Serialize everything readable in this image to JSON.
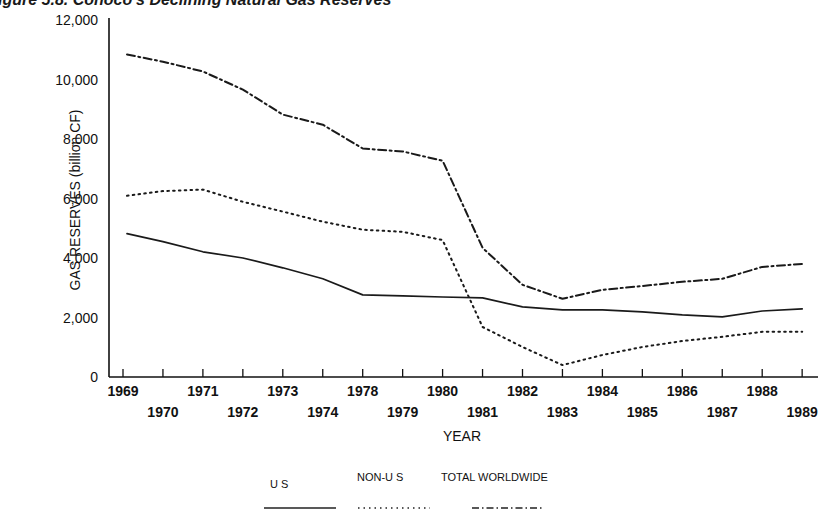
{
  "title": "igure 5.8. Conoco's Declining Natural Gas Reserves",
  "chart_data": {
    "type": "line",
    "title": "Conoco's Declining Natural Gas Reserves",
    "xlabel": "YEAR",
    "ylabel": "GAS RESERVES (billion CF)",
    "ylim": [
      0,
      12000
    ],
    "yticks": [
      0,
      2000,
      4000,
      6000,
      8000,
      10000,
      12000
    ],
    "ytick_labels": [
      "0",
      "2,000",
      "4,000",
      "6,000",
      "8,000",
      "10,000",
      "12,000"
    ],
    "grid": false,
    "legend_position": "bottom",
    "categories": [
      "1969",
      "1970",
      "1971",
      "1972",
      "1973",
      "1974",
      "1978",
      "1979",
      "1980",
      "1981",
      "1982",
      "1983",
      "1984",
      "1985",
      "1986",
      "1987",
      "1988",
      "1989"
    ],
    "series": [
      {
        "name": "U S",
        "style": "solid",
        "values": [
          4820,
          4550,
          4210,
          4000,
          3670,
          3300,
          2760,
          2730,
          2690,
          2660,
          2360,
          2260,
          2260,
          2190,
          2090,
          2020,
          2220,
          2290
        ]
      },
      {
        "name": "NON-U S",
        "style": "dotted",
        "values": [
          6090,
          6250,
          6300,
          5890,
          5560,
          5220,
          4950,
          4880,
          4600,
          1680,
          1010,
          400,
          740,
          1010,
          1210,
          1350,
          1520,
          1520
        ]
      },
      {
        "name": "TOTAL WORLDWIDE",
        "style": "dash-dot",
        "values": [
          10840,
          10600,
          10270,
          9660,
          8820,
          8480,
          7680,
          7580,
          7270,
          4340,
          3100,
          2630,
          2930,
          3060,
          3200,
          3300,
          3700,
          3800
        ]
      }
    ]
  },
  "legend": {
    "us": "U S",
    "non_us": "NON-U S",
    "total": "TOTAL WORLDWIDE"
  }
}
